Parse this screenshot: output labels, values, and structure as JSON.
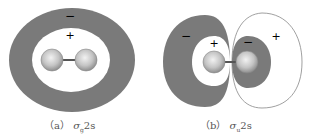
{
  "figures": [
    {
      "id": "a",
      "caption_prefix": "（a）",
      "caption_symbol": "σ",
      "caption_sub": "g",
      "caption_suffix": "2s",
      "signs": {
        "outer": "−",
        "inner": "+"
      }
    },
    {
      "id": "b",
      "caption_prefix": "（b）",
      "caption_symbol": "σ",
      "caption_sub": "u",
      "caption_suffix": "2s",
      "signs": {
        "left_outer": "−",
        "left_inner": "+",
        "right_inner": "−",
        "right_outer": "+"
      }
    }
  ],
  "colors": {
    "shaded": "#7a7a7a",
    "outline": "#888888",
    "atom_light": "#e8e8e8",
    "atom_dark": "#9a9a9a",
    "bond": "#666666"
  }
}
